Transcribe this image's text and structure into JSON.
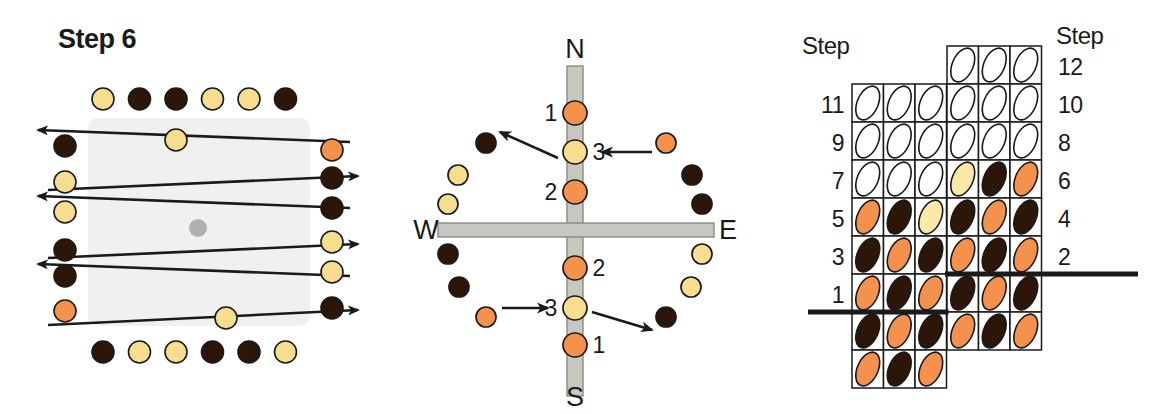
{
  "figure": {
    "title": "Step 6",
    "panels": [
      "orbit-rows-panel",
      "compass-panel",
      "step-grid-panel"
    ]
  },
  "palette": {
    "dark": "#2b1608",
    "yellow": "#f7dd8e",
    "orange": "#f4924d",
    "pale_yellow": "#fbe9a8",
    "white": "#ffffff",
    "gray_dot": "#b0b0b0",
    "bar_gray": "#c8c8c2",
    "plate": "#f0f0ee",
    "stroke": "#1a1a1a"
  },
  "left_panel": {
    "name": "orbit-rows-panel",
    "title": "Step 6",
    "center_marker": "gray-dot",
    "top_row": [
      "yellow",
      "dark",
      "dark",
      "yellow",
      "yellow",
      "dark"
    ],
    "bottom_row": [
      "dark",
      "yellow",
      "yellow",
      "dark",
      "dark",
      "yellow"
    ],
    "left_column": [
      "dark",
      "yellow",
      "yellow",
      "dark",
      "dark",
      "orange"
    ],
    "right_column": [
      "orange",
      "dark",
      "dark",
      "yellow",
      "yellow",
      "dark"
    ],
    "inline_markers": [
      "yellow",
      "yellow"
    ],
    "arrow_directions": [
      "left",
      "right",
      "left",
      "right",
      "left",
      "right"
    ]
  },
  "compass_panel": {
    "name": "compass-panel",
    "cardinals": {
      "north": "N",
      "south": "S",
      "west": "W",
      "east": "E"
    },
    "axis_dots_north": [
      {
        "label": "1",
        "color": "orange",
        "label_side": "left"
      },
      {
        "label": "3",
        "color": "yellow",
        "label_side": "right"
      },
      {
        "label": "2",
        "color": "orange",
        "label_side": "left"
      }
    ],
    "axis_dots_south": [
      {
        "label": "2",
        "color": "orange",
        "label_side": "right"
      },
      {
        "label": "3",
        "color": "yellow",
        "label_side": "left"
      },
      {
        "label": "1",
        "color": "orange",
        "label_side": "right"
      }
    ],
    "ring_west": [
      "dark",
      "yellow",
      "yellow",
      "dark",
      "dark",
      "orange"
    ],
    "ring_east": [
      "orange",
      "dark",
      "dark",
      "yellow",
      "yellow",
      "dark"
    ],
    "arrows": [
      {
        "from": "east-orange-dot",
        "to": "north-3-dot",
        "direction": "left"
      },
      {
        "from": "north-3-dot",
        "to": "west-dark-dot",
        "direction": "upper-left"
      },
      {
        "from": "west-orange-dot",
        "to": "south-3-dot",
        "direction": "right"
      },
      {
        "from": "south-3-dot",
        "to": "east-dark-dot",
        "direction": "lower-right"
      }
    ]
  },
  "grid_panel": {
    "name": "step-grid-panel",
    "left_header": "Step",
    "right_header": "Step",
    "left_labels": [
      "11",
      "9",
      "7",
      "5",
      "3",
      "1"
    ],
    "right_labels": [
      "12",
      "10",
      "8",
      "6",
      "4",
      "2"
    ],
    "left_grid": {
      "rows": 8,
      "cols": 3,
      "cells": [
        [
          "white",
          "white",
          "white"
        ],
        [
          "white",
          "white",
          "white"
        ],
        [
          "white",
          "white",
          "white"
        ],
        [
          "orange",
          "dark",
          "pale_yellow"
        ],
        [
          "dark",
          "orange",
          "dark"
        ],
        [
          "orange",
          "dark",
          "orange"
        ],
        [
          "dark",
          "orange",
          "dark"
        ],
        [
          "orange",
          "dark",
          "orange"
        ]
      ]
    },
    "right_grid": {
      "rows": 8,
      "cols": 3,
      "cells": [
        [
          "white",
          "white",
          "white"
        ],
        [
          "white",
          "white",
          "white"
        ],
        [
          "white",
          "white",
          "white"
        ],
        [
          "pale_yellow",
          "dark",
          "orange"
        ],
        [
          "dark",
          "orange",
          "dark"
        ],
        [
          "orange",
          "dark",
          "orange"
        ],
        [
          "dark",
          "orange",
          "dark"
        ],
        [
          "orange",
          "dark",
          "orange"
        ]
      ]
    },
    "baselines": [
      "left-baseline-step-1",
      "right-baseline-step-2"
    ]
  }
}
